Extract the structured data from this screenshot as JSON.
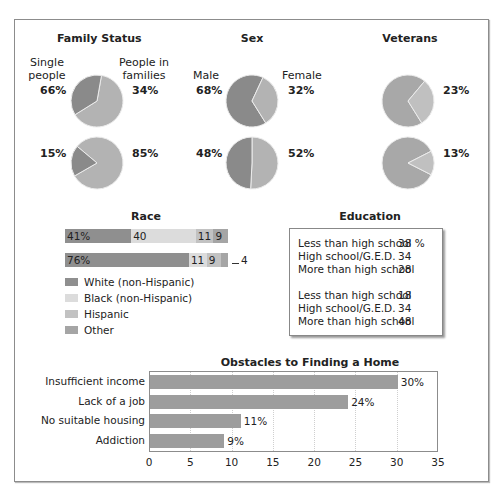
{
  "chart_data": [
    {
      "type": "pie",
      "title": "Family Status",
      "labels": [
        "Single people",
        "People in families"
      ],
      "pies": [
        {
          "values": [
            66,
            34
          ],
          "label_left": "66%",
          "label_right": "34%"
        },
        {
          "values": [
            15,
            85
          ],
          "label_left": "15%",
          "label_right": "85%"
        }
      ]
    },
    {
      "type": "pie",
      "title": "Sex",
      "labels": [
        "Male",
        "Female"
      ],
      "pies": [
        {
          "values": [
            68,
            32
          ],
          "label_left": "68%",
          "label_right": "32%"
        },
        {
          "values": [
            48,
            52
          ],
          "label_left": "48%",
          "label_right": "52%"
        }
      ]
    },
    {
      "type": "pie",
      "title": "Veterans",
      "labels": [
        "Veterans"
      ],
      "pies": [
        {
          "values": [
            23,
            77
          ],
          "label_right": "23%"
        },
        {
          "values": [
            13,
            87
          ],
          "label_right": "13%"
        }
      ]
    },
    {
      "type": "bar",
      "orientation": "horizontal-stacked",
      "title": "Race",
      "categories": [
        "Row 1",
        "Row 2"
      ],
      "series": [
        {
          "name": "White (non-Hispanic)",
          "values": [
            41,
            76
          ]
        },
        {
          "name": "Black (non-Hispanic)",
          "values": [
            40,
            11
          ]
        },
        {
          "name": "Hispanic",
          "values": [
            11,
            9
          ]
        },
        {
          "name": "Other",
          "values": [
            9,
            4
          ]
        }
      ],
      "data_labels": [
        [
          "41%",
          "40",
          "11",
          "9"
        ],
        [
          "76%",
          "11",
          "9",
          "4"
        ]
      ]
    },
    {
      "type": "table",
      "title": "Education",
      "groups": [
        [
          {
            "label": "Less than high school",
            "value": 38
          },
          {
            "label": "High school/G.E.D.",
            "value": 34
          },
          {
            "label": "More than high school",
            "value": 28
          }
        ],
        [
          {
            "label": "Less than high school",
            "value": 18
          },
          {
            "label": "High school/G.E.D.",
            "value": 34
          },
          {
            "label": "More than high school",
            "value": 48
          }
        ]
      ]
    },
    {
      "type": "bar",
      "orientation": "horizontal",
      "title": "Obstacles to Finding a Home",
      "categories": [
        "Insufficient income",
        "Lack of a job",
        "No suitable housing",
        "Addiction"
      ],
      "values": [
        30,
        24,
        11,
        9
      ],
      "data_labels": [
        "30%",
        "24%",
        "11%",
        "9%"
      ],
      "xlim": [
        0,
        35
      ],
      "xticks": [
        0,
        5,
        10,
        15,
        20,
        25,
        30,
        35
      ],
      "grid": true
    }
  ],
  "family": {
    "title": "Family Status",
    "left_label_1": "Single",
    "left_label_2": "people",
    "right_label_1": "People in",
    "right_label_2": "families",
    "p1_left": "66%",
    "p1_right": "34%",
    "p2_left": "15%",
    "p2_right": "85%"
  },
  "sex": {
    "title": "Sex",
    "left_label": "Male",
    "right_label": "Female",
    "p1_left": "68%",
    "p1_right": "32%",
    "p2_left": "48%",
    "p2_right": "52%"
  },
  "veterans": {
    "title": "Veterans",
    "p1_right": "23%",
    "p2_right": "13%"
  },
  "race": {
    "title": "Race",
    "rows": [
      {
        "segments": [
          {
            "value": 41,
            "label": "41%"
          },
          {
            "value": 40,
            "label": "40"
          },
          {
            "value": 11,
            "label": "11"
          },
          {
            "value": 9,
            "label": "9"
          }
        ]
      },
      {
        "segments": [
          {
            "value": 76,
            "label": "76%"
          },
          {
            "value": 11,
            "label": "11"
          },
          {
            "value": 9,
            "label": "9"
          },
          {
            "value": 4,
            "label": ""
          }
        ],
        "callout": "4"
      }
    ],
    "legend": [
      {
        "label": "White (non-Hispanic)",
        "color": "#8f8f8f"
      },
      {
        "label": "Black (non-Hispanic)",
        "color": "#dcdcdc"
      },
      {
        "label": "Hispanic",
        "color": "#c2c2c2"
      },
      {
        "label": "Other",
        "color": "#a5a5a5"
      }
    ]
  },
  "education": {
    "title": "Education",
    "rows": [
      {
        "label": "Less than high school",
        "value": "38 %"
      },
      {
        "label": "High school/G.E.D.",
        "value": "34"
      },
      {
        "label": "More than high school",
        "value": "28"
      },
      {
        "label": "Less than high school",
        "value": "18"
      },
      {
        "label": "High school/G.E.D.",
        "value": "34"
      },
      {
        "label": "More than high school",
        "value": "48"
      }
    ]
  },
  "obstacles": {
    "title": "Obstacles to Finding a Home",
    "bars": [
      {
        "label": "Insufficient income",
        "value": 30,
        "value_label": "30%"
      },
      {
        "label": "Lack of a job",
        "value": 24,
        "value_label": "24%"
      },
      {
        "label": "No suitable housing",
        "value": 11,
        "value_label": "11%"
      },
      {
        "label": "Addiction",
        "value": 9,
        "value_label": "9%"
      }
    ],
    "ticks": [
      "0",
      "5",
      "10",
      "15",
      "20",
      "25",
      "30",
      "35"
    ],
    "max": 35
  },
  "colors": {
    "pie_dark": "#8a8a8a",
    "pie_light": "#b3b3b3",
    "vet_main": "#a8a8a8",
    "vet_slice": "#c0c0c0",
    "obstacle_bar": "#9d9d9d"
  }
}
